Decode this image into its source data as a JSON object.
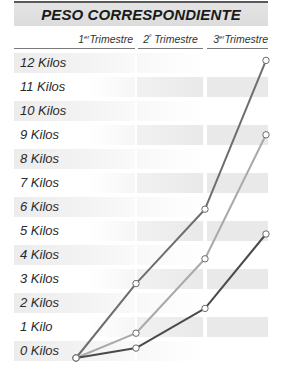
{
  "chart_data": {
    "type": "line",
    "title": "PESO CORRESPONDIENTE",
    "xlabel": "",
    "ylabel": "",
    "categories": [
      "",
      "1er Trimestre",
      "2º Trimestre",
      "3er Trimestre"
    ],
    "x": [
      0,
      1,
      2,
      3
    ],
    "y_tick_labels": [
      "12 Kilos",
      "11 Kilos",
      "10 Kilos",
      "9 Kilos",
      "8 Kilos",
      "7 Kilos",
      "6 Kilos",
      "5 Kilos",
      "4 Kilos",
      "3 Kilos",
      "2 Kilos",
      "1 Kilo",
      "0 Kilos"
    ],
    "ylim": [
      0,
      12
    ],
    "grid": "alternating row bands",
    "legend": "none",
    "series": [
      {
        "name": "Serie 1 (gris medio)",
        "color": "#6e6e6e",
        "values": [
          0,
          3,
          6,
          12
        ]
      },
      {
        "name": "Serie 2 (gris claro)",
        "color": "#a9a9a9",
        "values": [
          0,
          1,
          4,
          9
        ]
      },
      {
        "name": "Serie 3 (gris oscuro)",
        "color": "#4a4a4a",
        "values": [
          0,
          0.4,
          2,
          5
        ]
      }
    ]
  },
  "header": {
    "title": "PESO CORRESPONDIENTE"
  },
  "columns": [
    {
      "num": "1",
      "sup": "er",
      "label": "Trimestre"
    },
    {
      "num": "2",
      "sup": "º",
      "label": " Trimestre"
    },
    {
      "num": "3",
      "sup": "er",
      "label": "Trimestre"
    }
  ],
  "rows": [
    {
      "label": "12 Kilos"
    },
    {
      "label": "11 Kilos"
    },
    {
      "label": "10 Kilos"
    },
    {
      "label": "9 Kilos"
    },
    {
      "label": "8 Kilos"
    },
    {
      "label": "7 Kilos"
    },
    {
      "label": "6 Kilos"
    },
    {
      "label": "5 Kilos"
    },
    {
      "label": "4 Kilos"
    },
    {
      "label": "3 Kilos"
    },
    {
      "label": "2 Kilos"
    },
    {
      "label": "1 Kilo"
    },
    {
      "label": "0 Kilos"
    }
  ]
}
